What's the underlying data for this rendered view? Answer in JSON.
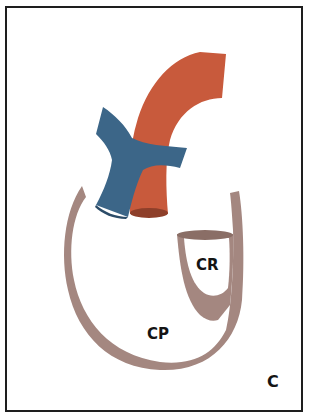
{
  "figure": {
    "panel_letter": "C",
    "labels": {
      "cr": "CR",
      "cp": "CP"
    },
    "structures": [
      {
        "id": "aorta",
        "color": "#c85a3c"
      },
      {
        "id": "pulmonary-trunk",
        "color": "#3c6688"
      },
      {
        "id": "pericardium",
        "color": "#a48780"
      }
    ],
    "colors": {
      "aorta": "#c85a3c",
      "aorta_dark": "#8e3f2a",
      "pulmonary": "#3c6688",
      "pulmonary_dark": "#2c4c68",
      "pericardium": "#a48780",
      "pericardium_dark": "#8a6e66",
      "border": "#1e1e1e",
      "text": "#141414"
    }
  }
}
